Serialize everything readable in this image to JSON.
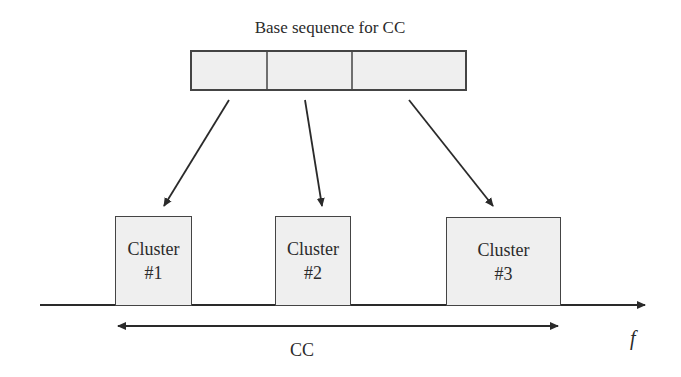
{
  "diagram": {
    "title": "Base sequence for CC",
    "base_sequence": {
      "segments": 3,
      "fill_color": "#efefef"
    },
    "clusters": [
      {
        "line1": "Cluster",
        "line2": "#1"
      },
      {
        "line1": "Cluster",
        "line2": "#2"
      },
      {
        "line1": "Cluster",
        "line2": "#3"
      }
    ],
    "span_label": "CC",
    "axis_label": "f",
    "colors": {
      "line": "#333333",
      "box_fill": "#efefef",
      "box_border": "#444444"
    }
  }
}
